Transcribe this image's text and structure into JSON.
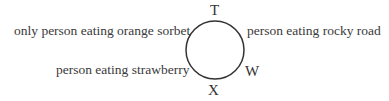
{
  "diagram": {
    "type": "circular-seating",
    "circle": {
      "cx": 215,
      "cy": 50,
      "r": 29,
      "stroke": "#333333"
    },
    "positions": [
      {
        "letter": "T",
        "position": "top"
      },
      {
        "letter": "W",
        "position": "lower-right"
      },
      {
        "letter": "X",
        "position": "bottom"
      }
    ],
    "labels": [
      {
        "text": "only person eating orange sorbet",
        "position": "upper-left"
      },
      {
        "text": "person eating rocky road",
        "position": "upper-right"
      },
      {
        "text": "person eating strawberry",
        "position": "lower-left"
      }
    ]
  }
}
